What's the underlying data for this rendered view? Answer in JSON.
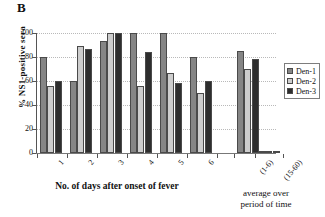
{
  "panel": {
    "letter": "B"
  },
  "chart_data": {
    "type": "bar",
    "title": "",
    "xlabel": "No. of days after onset of fever",
    "ylabel": "% NS1-positive sera",
    "ylim": [
      0,
      100
    ],
    "yticks": [
      0,
      20,
      40,
      60,
      80,
      100
    ],
    "ytick_labels": [
      "0",
      "20",
      "40",
      "60",
      "80",
      "100"
    ],
    "grid": true,
    "grid_style": "dotted horizontal",
    "legend_position": "right",
    "categories": [
      "1",
      "2",
      "3",
      "4",
      "5",
      "6",
      "(1-6)",
      "(15-60)"
    ],
    "series": [
      {
        "name": "Den-1",
        "color": "#858585",
        "values": [
          80,
          60,
          93,
          100,
          100,
          80,
          85,
          0
        ]
      },
      {
        "name": "Den-2",
        "color": "#cdcdcd",
        "values": [
          56,
          89,
          100,
          56,
          67,
          50,
          70,
          0
        ]
      },
      {
        "name": "Den-3",
        "color": "#2e2e2e",
        "values": [
          60,
          87,
          100,
          84,
          58,
          60,
          78,
          1
        ]
      }
    ],
    "annotations": {
      "secondary_xlabel": "average over\nperiod of time",
      "secondary_xlabel_line1": "average over",
      "secondary_xlabel_line2": "period of time"
    }
  },
  "legend": {
    "items": [
      {
        "label": "Den-1",
        "color": "#858585"
      },
      {
        "label": "Den-2",
        "color": "#cdcdcd"
      },
      {
        "label": "Den-3",
        "color": "#2e2e2e"
      }
    ]
  }
}
